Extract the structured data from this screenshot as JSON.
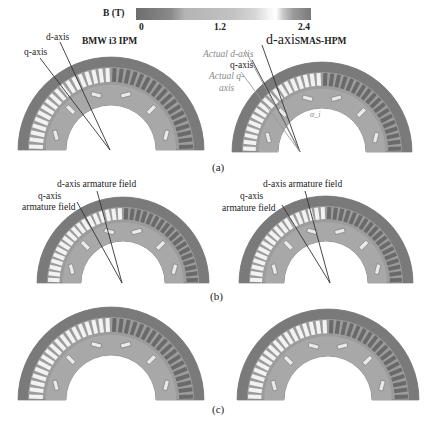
{
  "colorbar": {
    "title": "B (T)",
    "ticks": [
      "0",
      "1.2",
      "2.4"
    ]
  },
  "panel_a": {
    "caption": "(a)",
    "left": {
      "title": "BMW i3 IPM",
      "d_axis": "d-axis",
      "q_axis": "q-axis"
    },
    "right": {
      "title": "MAS-HPM",
      "d_axis": "d-axis",
      "q_axis": "q-axis",
      "actual_d_axis": "Actual d-axis",
      "actual_q_axis_line1": "Actual q-",
      "actual_q_axis_line2": "axis",
      "angle_label": "α_i"
    }
  },
  "panel_b": {
    "caption": "(b)",
    "left": {
      "d_field": "d-axis armature field",
      "q_field_line1": "q-axis",
      "q_field_line2": "armature field"
    },
    "right": {
      "d_field": "d-axis armature field",
      "q_field_line1": "q-axis",
      "q_field_line2": "armature field"
    }
  },
  "panel_c": {
    "caption": "(c)"
  },
  "colors": {
    "stator_dark": "#7a7a7a",
    "stator_mid": "#9c9c9c",
    "slot_light": "#f2f2f2",
    "rotor": "#a8a8a8",
    "axis_line": "#333333",
    "gray_label": "#8a8a8a"
  }
}
